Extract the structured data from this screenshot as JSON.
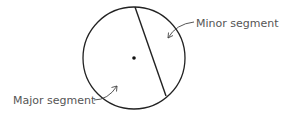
{
  "diagram": {
    "colors": {
      "stroke": "#222222",
      "text": "#555555",
      "background": "#ffffff"
    },
    "circle": {
      "cx": 134,
      "cy": 58,
      "r": 51
    },
    "chord": {
      "x1": 135,
      "y1": 7,
      "x2": 166,
      "y2": 96
    },
    "center_point": {
      "cx": 134,
      "cy": 58,
      "r": 1.8
    },
    "labels": {
      "minor": {
        "text": "Minor segment",
        "x": 196,
        "y": 27
      },
      "major": {
        "text": "Major segment",
        "x": 13,
        "y": 104
      }
    },
    "arrows": {
      "minor": {
        "description": "curved arrow from Minor segment label into minor segment",
        "path": "M 194 22 Q 176 24 168 38",
        "head": "M 168 38 L 168.5 32.5 M 168 38 L 173 35.5"
      },
      "major": {
        "description": "curved arrow from Major segment label into major segment",
        "path": "M 94 100 Q 108 100 117 86",
        "head": "M 117 86 L 111.5 87.5 M 117 86 L 116.5 91.5"
      }
    }
  }
}
